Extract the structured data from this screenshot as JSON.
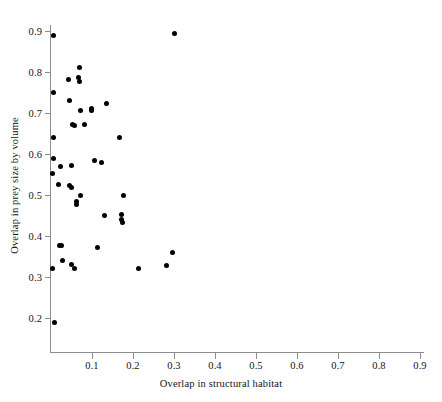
{
  "chart_data": {
    "type": "scatter",
    "title": "",
    "xlabel": "Overlap in structural habitat",
    "ylabel": "Overlap in prey size by volume",
    "xlim": [
      0.0,
      0.92
    ],
    "ylim": [
      0.145,
      0.915
    ],
    "xticks": [
      0.1,
      0.2,
      0.3,
      0.4,
      0.5,
      0.6,
      0.7,
      0.8,
      0.9
    ],
    "yticks": [
      0.2,
      0.3,
      0.4,
      0.5,
      0.6,
      0.7,
      0.8,
      0.9
    ],
    "xticklabels": [
      "0.1",
      "0.2",
      "0.3",
      "0.4",
      "0.5",
      "0.6",
      "0.7",
      "0.8",
      "0.9"
    ],
    "yticklabels": [
      "0.2",
      "0.3",
      "0.4",
      "0.5",
      "0.6",
      "0.7",
      "0.8",
      "0.9"
    ],
    "grid": false,
    "legend": null,
    "marker": "filled-circle",
    "marker_color": "#000000",
    "axis_color": "#8d8d8d",
    "background_color": "#ffffff",
    "n_points": 48,
    "points": [
      {
        "x": 0.005,
        "y": 0.89
      },
      {
        "x": 0.005,
        "y": 0.75
      },
      {
        "x": 0.005,
        "y": 0.64
      },
      {
        "x": 0.005,
        "y": 0.59
      },
      {
        "x": 0.004,
        "y": 0.553
      },
      {
        "x": 0.004,
        "y": 0.32
      },
      {
        "x": 0.008,
        "y": 0.19
      },
      {
        "x": 0.022,
        "y": 0.57
      },
      {
        "x": 0.019,
        "y": 0.525
      },
      {
        "x": 0.029,
        "y": 0.34
      },
      {
        "x": 0.021,
        "y": 0.377
      },
      {
        "x": 0.026,
        "y": 0.377
      },
      {
        "x": 0.043,
        "y": 0.782
      },
      {
        "x": 0.046,
        "y": 0.73
      },
      {
        "x": 0.049,
        "y": 0.572
      },
      {
        "x": 0.044,
        "y": 0.522
      },
      {
        "x": 0.05,
        "y": 0.518
      },
      {
        "x": 0.051,
        "y": 0.33
      },
      {
        "x": 0.058,
        "y": 0.32
      },
      {
        "x": 0.053,
        "y": 0.671
      },
      {
        "x": 0.057,
        "y": 0.669
      },
      {
        "x": 0.062,
        "y": 0.484
      },
      {
        "x": 0.063,
        "y": 0.477
      },
      {
        "x": 0.069,
        "y": 0.81
      },
      {
        "x": 0.068,
        "y": 0.786
      },
      {
        "x": 0.069,
        "y": 0.778
      },
      {
        "x": 0.071,
        "y": 0.706
      },
      {
        "x": 0.072,
        "y": 0.498
      },
      {
        "x": 0.082,
        "y": 0.671
      },
      {
        "x": 0.098,
        "y": 0.712
      },
      {
        "x": 0.099,
        "y": 0.706
      },
      {
        "x": 0.107,
        "y": 0.585
      },
      {
        "x": 0.114,
        "y": 0.372
      },
      {
        "x": 0.123,
        "y": 0.58
      },
      {
        "x": 0.131,
        "y": 0.451
      },
      {
        "x": 0.136,
        "y": 0.723
      },
      {
        "x": 0.166,
        "y": 0.641
      },
      {
        "x": 0.176,
        "y": 0.499
      },
      {
        "x": 0.173,
        "y": 0.452
      },
      {
        "x": 0.173,
        "y": 0.44
      },
      {
        "x": 0.174,
        "y": 0.432
      },
      {
        "x": 0.214,
        "y": 0.321
      },
      {
        "x": 0.282,
        "y": 0.327
      },
      {
        "x": 0.296,
        "y": 0.36
      },
      {
        "x": 0.3,
        "y": 0.895
      }
    ]
  },
  "axes": {
    "ylabel": "Overlap in prey size by volume",
    "xlabel": "Overlap in structural habitat"
  }
}
